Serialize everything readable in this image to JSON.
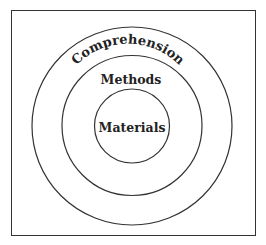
{
  "diagram": {
    "type": "concentric-circles",
    "layers": [
      {
        "label": "Comprehension",
        "level": "outer"
      },
      {
        "label": "Methods",
        "level": "middle"
      },
      {
        "label": "Materials",
        "level": "inner"
      }
    ]
  },
  "labels": {
    "outer": "Comprehension",
    "middle": "Methods",
    "inner": "Materials"
  }
}
